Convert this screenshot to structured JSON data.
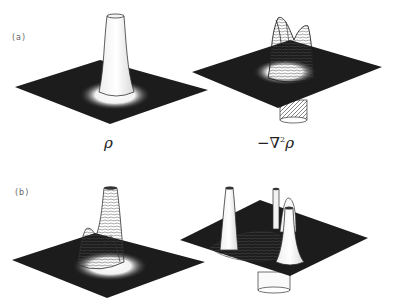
{
  "figure": {
    "rows": [
      {
        "label": "(a)",
        "plots": [
          {
            "id": "a-rho",
            "quantity": "density",
            "caption": "ρ"
          },
          {
            "id": "a-laplacian",
            "quantity": "negative Laplacian of density",
            "caption": "−∇²ρ"
          }
        ]
      },
      {
        "label": "(b)",
        "plots": [
          {
            "id": "b-rho",
            "quantity": "density"
          },
          {
            "id": "b-laplacian",
            "quantity": "negative Laplacian of density"
          }
        ]
      }
    ],
    "captions": {
      "rho": "ρ",
      "neg_laplacian_prefix": "−∇",
      "neg_laplacian_sup": "2",
      "neg_laplacian_suffix": "ρ"
    },
    "colors": {
      "surface_dark": "#1a1a1a",
      "surface_light": "#ffffff",
      "line": "#222222",
      "label": "#666666"
    }
  }
}
